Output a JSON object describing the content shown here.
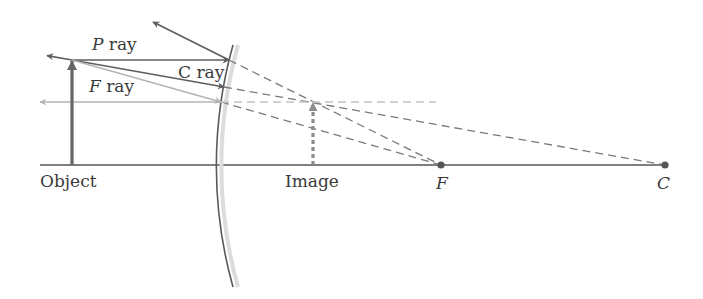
{
  "diagram": {
    "labels": {
      "p_ray_letter": "P",
      "c_ray_letter": "C",
      "f_ray_letter": "F",
      "ray_word": " ray",
      "object": "Object",
      "image": "Image",
      "focal_point": "F",
      "center_of_curvature": "C"
    },
    "colors": {
      "ray_dark": "#5e5e5e",
      "ray_light": "#b4b4b4",
      "axis": "#555555",
      "mirror": "#5a5a5a",
      "mirror_back": "#dcdcdc",
      "text": "#3a3a3a"
    },
    "geometry": {
      "axis_y": 165,
      "object_x": 72,
      "object_top_y": 60,
      "image_x": 313,
      "image_top_y": 102,
      "mirror_vertex_x": 217,
      "focal_point_x": 441,
      "center_x": 665
    }
  }
}
